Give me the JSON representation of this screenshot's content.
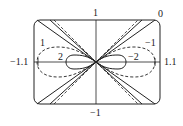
{
  "diagram": {
    "type": "parametric curve family plot",
    "axis_labels": {
      "top": "1",
      "bottom": "−1",
      "left": "−1.1",
      "right": "1.1"
    },
    "curve_labels": [
      {
        "text": "0",
        "pos": "top-right"
      },
      {
        "text": "1",
        "pos": "upper-left"
      },
      {
        "text": "−1",
        "pos": "upper-right"
      },
      {
        "text": "2",
        "pos": "left-inner"
      },
      {
        "text": "−2",
        "pos": "right-inner"
      }
    ],
    "colors": {
      "stroke": "#222222",
      "background": "#ffffff"
    }
  }
}
